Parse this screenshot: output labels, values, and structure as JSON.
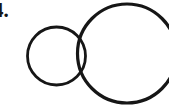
{
  "figure": {
    "item_number": "4.",
    "background_color": "#ffffff",
    "ink_color": "#161616",
    "canvas": {
      "width": 169,
      "height": 105
    },
    "shapes": [
      {
        "name": "left-circle",
        "type": "circle",
        "cx": 56.5,
        "cy": 56.0,
        "r": 29.0,
        "stroke_width": 2.8,
        "clipped": false
      },
      {
        "name": "right-circle",
        "type": "circle",
        "cx": 127.0,
        "cy": 53.5,
        "r": 49.5,
        "stroke_width": 3.2,
        "clipped": true
      }
    ],
    "intersection": {
      "name": "lens-overlap",
      "upper_point_x": 80,
      "upper_point_y": 31,
      "lower_point_x": 80,
      "lower_point_y": 80
    }
  }
}
